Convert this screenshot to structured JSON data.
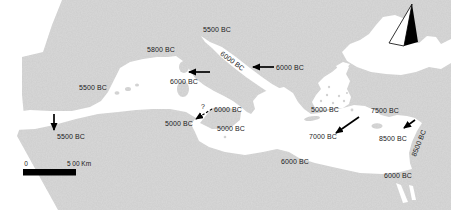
{
  "map": {
    "colors": {
      "land": "#d9d9d9",
      "sea": "#ffffff",
      "text": "#1a1a1a",
      "arrow": "#000000",
      "scale_bar": "#000000"
    },
    "icons": {
      "north_arrow": "north-arrow-icon"
    },
    "labels": [
      {
        "id": "label-north-adriatic",
        "text": "5500 BC",
        "x": 217,
        "y": 32,
        "rotate": 0
      },
      {
        "id": "label-south-france",
        "text": "5800 BC",
        "x": 161,
        "y": 52,
        "rotate": 0
      },
      {
        "id": "label-adriatic-coast",
        "text": "6000 BC",
        "x": 231,
        "y": 63,
        "rotate": 36
      },
      {
        "id": "label-balkans",
        "text": "6000 BC",
        "x": 290,
        "y": 70,
        "rotate": 0
      },
      {
        "id": "label-corsica",
        "text": "6000 BC",
        "x": 184,
        "y": 84,
        "rotate": 0
      },
      {
        "id": "label-tyrrhenian",
        "text": "6000 BC",
        "x": 228,
        "y": 112,
        "rotate": 0
      },
      {
        "id": "label-sicily-west",
        "text": "5000 BC",
        "x": 179,
        "y": 126,
        "rotate": 0
      },
      {
        "id": "label-sicily-south",
        "text": "5000 BC",
        "x": 231,
        "y": 131,
        "rotate": 0
      },
      {
        "id": "label-iberia",
        "text": "5500 BC",
        "x": 93,
        "y": 90,
        "rotate": 0
      },
      {
        "id": "label-morocco",
        "text": "5500 BC",
        "x": 71,
        "y": 139,
        "rotate": 0
      },
      {
        "id": "label-greece",
        "text": "5000 BC",
        "x": 325,
        "y": 112,
        "rotate": 0
      },
      {
        "id": "label-anatolia",
        "text": "7500 BC",
        "x": 385,
        "y": 113,
        "rotate": 0
      },
      {
        "id": "label-east-aegean",
        "text": "7000 BC",
        "x": 323,
        "y": 139,
        "rotate": 0
      },
      {
        "id": "label-cyprus-sea",
        "text": "8500 BC",
        "x": 393,
        "y": 141,
        "rotate": 0
      },
      {
        "id": "label-levant-coast",
        "text": "8500 BC",
        "x": 421,
        "y": 144,
        "rotate": -68
      },
      {
        "id": "label-libya",
        "text": "6000 BC",
        "x": 295,
        "y": 164,
        "rotate": 0
      },
      {
        "id": "label-egypt",
        "text": "6000 BC",
        "x": 398,
        "y": 178,
        "rotate": 0
      },
      {
        "id": "question-mark",
        "text": "?",
        "x": 203,
        "y": 109,
        "rotate": 0
      }
    ],
    "arrows": [
      {
        "id": "arrow-adriatic",
        "x1": 274,
        "y1": 67,
        "x2": 253,
        "y2": 67,
        "style": "solid"
      },
      {
        "id": "arrow-corsica",
        "x1": 210,
        "y1": 72,
        "x2": 189,
        "y2": 72,
        "style": "solid"
      },
      {
        "id": "arrow-sicily",
        "x1": 212,
        "y1": 109,
        "x2": 196,
        "y2": 119,
        "style": "dashed"
      },
      {
        "id": "arrow-aegean",
        "x1": 359,
        "y1": 117,
        "x2": 336,
        "y2": 133,
        "style": "solid"
      },
      {
        "id": "arrow-levant",
        "x1": 415,
        "y1": 120,
        "x2": 404,
        "y2": 128,
        "style": "solid"
      },
      {
        "id": "arrow-gibraltar",
        "x1": 54,
        "y1": 114,
        "x2": 54,
        "y2": 130,
        "style": "solid"
      }
    ],
    "scale_bar": {
      "zero_label": "0",
      "distance_label": "5 00 Km"
    }
  }
}
